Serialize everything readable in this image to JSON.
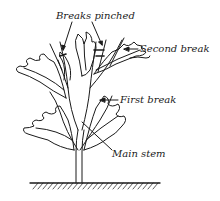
{
  "figure": {
    "type": "botanical-illustration",
    "ink_color": "#1a1a1a",
    "background": "#ffffff"
  },
  "labels": {
    "breaks_pinched": "Breaks pinched",
    "second_break": "Second break",
    "first_break": "First break",
    "main_stem": "Main stem"
  }
}
